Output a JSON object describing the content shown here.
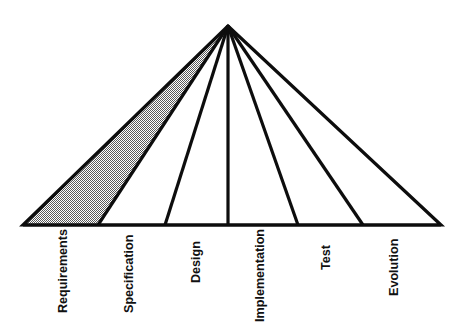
{
  "diagram": {
    "type": "fan-pyramid",
    "background_color": "#ffffff",
    "line_color": "#0d0d0d",
    "shaded_fill_color": "#999999",
    "unshaded_fill_color": "#ffffff",
    "apex": {
      "x": 228,
      "y": 26
    },
    "baseline": {
      "y": 225,
      "x_start": 23,
      "x_end": 441
    },
    "label_rotation_degrees": -90,
    "stages": [
      {
        "id": "requirements",
        "label": "Requirements",
        "shaded": true,
        "baseline_x_start": 23,
        "baseline_x_end": 98,
        "label_x": 67,
        "label_y": 313
      },
      {
        "id": "specification",
        "label": "Specification",
        "shaded": false,
        "baseline_x_start": 98,
        "baseline_x_end": 165,
        "label_x": 133,
        "label_y": 313
      },
      {
        "id": "design",
        "label": "Design",
        "shaded": false,
        "baseline_x_start": 165,
        "baseline_x_end": 228,
        "label_x": 200,
        "label_y": 283
      },
      {
        "id": "implementation",
        "label": "Implementation",
        "shaded": false,
        "baseline_x_start": 228,
        "baseline_x_end": 298,
        "label_x": 264,
        "label_y": 322
      },
      {
        "id": "test",
        "label": "Test",
        "shaded": false,
        "baseline_x_start": 298,
        "baseline_x_end": 363,
        "label_x": 330,
        "label_y": 270
      },
      {
        "id": "evolution",
        "label": "Evolution",
        "shaded": false,
        "baseline_x_start": 363,
        "baseline_x_end": 441,
        "label_x": 398,
        "label_y": 296
      }
    ]
  }
}
